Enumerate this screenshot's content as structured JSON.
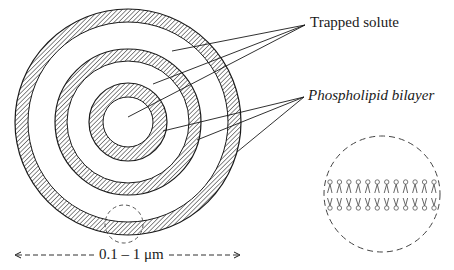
{
  "diagram": {
    "labels": {
      "trapped_solute": "Trapped solute",
      "phospholipid_bilayer": "Phospholipid bilayer",
      "scale": "0.1 – 1 μm"
    },
    "colors": {
      "ink": "#1a1a1a",
      "hatch": "#2a2a2a",
      "background": "#ffffff",
      "lipid": "#555555"
    },
    "liposome": {
      "center": [
        128,
        122
      ],
      "rings": [
        {
          "name": "outer-bilayer",
          "r_outer": 113,
          "r_inner": 100
        },
        {
          "name": "middle-bilayer",
          "r_outer": 73,
          "r_inner": 61
        },
        {
          "name": "inner-bilayer",
          "r_outer": 39,
          "r_inner": 25
        }
      ]
    },
    "leaders": {
      "trapped_solute": {
        "origin": [
          305,
          25
        ],
        "targets": [
          [
            172,
            51
          ],
          [
            153,
            84
          ],
          [
            128,
            117
          ]
        ]
      },
      "phospholipid_bilayer": {
        "origin": [
          304,
          97
        ],
        "targets": [
          [
            163,
            131
          ],
          [
            197,
            140
          ],
          [
            237,
            152
          ]
        ]
      }
    },
    "magnifier": {
      "small_center": [
        124,
        224
      ],
      "small_r": 19,
      "large_center": [
        382,
        194
      ],
      "large_r": 58,
      "lipids_per_leaflet": 12
    },
    "scale_bar": {
      "x1": 15,
      "x2": 240,
      "y": 255
    }
  }
}
